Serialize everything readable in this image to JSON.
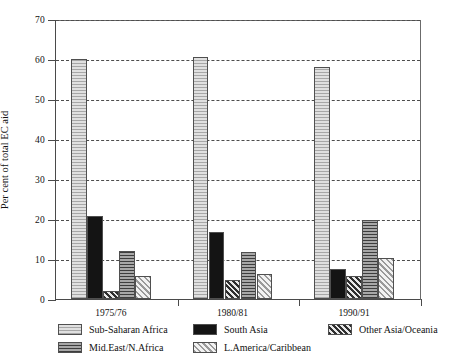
{
  "chart_data": {
    "type": "bar",
    "title": "",
    "subtitle": "",
    "xlabel": "",
    "ylabel": "Per cent of total EC aid",
    "categories": [
      "1975/76",
      "1980/81",
      "1990/91"
    ],
    "ylim": [
      0,
      70
    ],
    "yticks": [
      0,
      10,
      20,
      30,
      40,
      50,
      60,
      70
    ],
    "ytick_labels": [
      "0",
      "10",
      "20",
      "30",
      "40",
      "50",
      "60",
      "70"
    ],
    "grid": "horizontal-dashed",
    "legend_position": "bottom",
    "series": [
      {
        "name": "Sub-Saharan Africa",
        "values": [
          60.0,
          60.5,
          58.0
        ],
        "pattern": "light-grey-fine-horizontal",
        "color": "#e0e0e0"
      },
      {
        "name": "South Asia",
        "values": [
          20.8,
          16.8,
          7.5
        ],
        "pattern": "solid-black",
        "color": "#141414"
      },
      {
        "name": "Other Asia/Oceania",
        "values": [
          2.0,
          4.7,
          5.8
        ],
        "pattern": "diagonal-hatch",
        "color": "#cfcfcf"
      },
      {
        "name": "Mid.East/N.Africa",
        "values": [
          12.1,
          11.8,
          19.8
        ],
        "pattern": "dark-grey-horizontal",
        "color": "#8a8a8a"
      },
      {
        "name": "L.America/Caribbean",
        "values": [
          5.7,
          6.2,
          10.2
        ],
        "pattern": "light-cross-hatch",
        "color": "#e4e4e4"
      }
    ]
  },
  "axis": {
    "y_title": "Per cent of total EC aid"
  }
}
